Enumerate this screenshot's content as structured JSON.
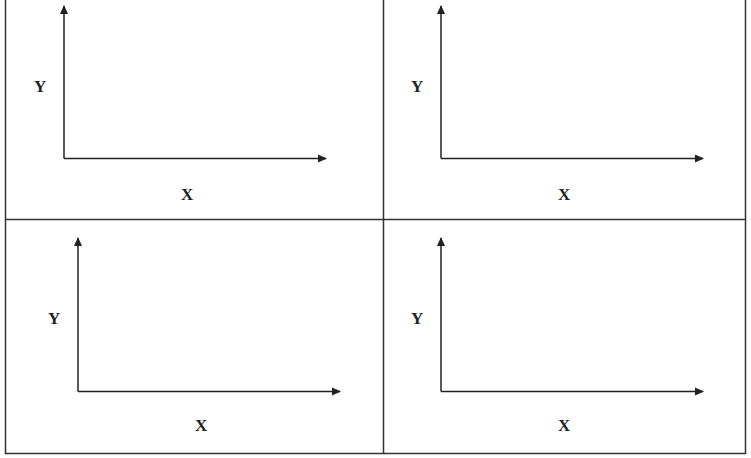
{
  "panels": [
    {
      "id": "top-left",
      "y_label": "Y",
      "x_label": "X"
    },
    {
      "id": "top-right",
      "y_label": "Y",
      "x_label": "X"
    },
    {
      "id": "bottom-left",
      "y_label": "Y",
      "x_label": "X"
    },
    {
      "id": "bottom-right",
      "y_label": "Y",
      "x_label": "X"
    }
  ],
  "colors": {
    "line": "#222222",
    "background": "#ffffff"
  }
}
